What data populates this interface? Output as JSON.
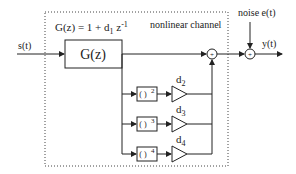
{
  "diagram": {
    "title_formula": "G(z) = 1 + d",
    "formula_sub": "1",
    "formula_tail": " z",
    "formula_sup": "-1",
    "channel_label": "nonlinear channel",
    "input_label": "s(t)",
    "output_label": "y(t)",
    "noise_label": "noise  e(t)",
    "main_block": "G(z)",
    "branches": [
      {
        "block": "( )",
        "power": "2",
        "gain": "d",
        "gain_sub": "2"
      },
      {
        "block": "( )",
        "power": "3",
        "gain": "d",
        "gain_sub": "3"
      },
      {
        "block": "( )",
        "power": "4",
        "gain": "d",
        "gain_sub": "4"
      }
    ],
    "sum_symbol": "+"
  }
}
